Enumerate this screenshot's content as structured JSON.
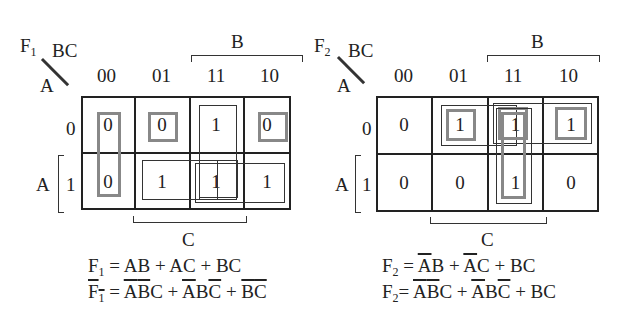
{
  "maps": [
    {
      "name": "F1",
      "func": "F",
      "sub": "1",
      "col_var": "BC",
      "row_var": "A",
      "col_labels": [
        "00",
        "01",
        "11",
        "10"
      ],
      "row_labels": [
        "0",
        "1"
      ],
      "top_brace_label": "B",
      "bottom_brace_label": "C",
      "left_brace_label": "A",
      "cells": [
        [
          "0",
          "0",
          "1",
          "0"
        ],
        [
          "0",
          "1",
          "1",
          "1"
        ]
      ],
      "eq1": {
        "lhs": "F",
        "sub": "1",
        "rhs": "= AB + AC + BC"
      },
      "eq2": {
        "lhs": "F",
        "sub": "1",
        "rhs_terms": [
          "A",
          "B",
          "C",
          " + ",
          "A",
          "B",
          "C",
          " + ",
          "B",
          "C"
        ]
      }
    },
    {
      "name": "F2",
      "func": "F",
      "sub": "2",
      "col_var": "BC",
      "row_var": "A",
      "col_labels": [
        "00",
        "01",
        "11",
        "10"
      ],
      "row_labels": [
        "0",
        "1"
      ],
      "top_brace_label": "B",
      "bottom_brace_label": "C",
      "left_brace_label": "A",
      "cells": [
        [
          "0",
          "1",
          "1",
          "1"
        ],
        [
          "0",
          "0",
          "1",
          "0"
        ]
      ],
      "eq1": {
        "lhs": "F",
        "sub": "2"
      },
      "eq2": {
        "lhs": "F",
        "sub": "2"
      }
    }
  ],
  "text": {
    "eq1_f1": "= AB + AC + BC",
    "eq2_f1_eq": "=",
    "plus": "+",
    "A": "A",
    "B": "B",
    "C": "C",
    "eq": "="
  }
}
